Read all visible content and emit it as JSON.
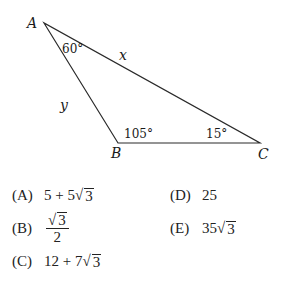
{
  "diagram": {
    "type": "triangle",
    "vertices": {
      "A": {
        "label": "A",
        "x": 44,
        "y": 23
      },
      "B": {
        "label": "B",
        "x": 118,
        "y": 143
      },
      "C": {
        "label": "C",
        "x": 260,
        "y": 143
      }
    },
    "angles": {
      "A": "60°",
      "B": "105°",
      "C": "15°"
    },
    "sides": {
      "AC": "x",
      "AB": "y"
    },
    "line_color": "#2a2a2a"
  },
  "choices": [
    {
      "key": "(A)",
      "prefix": "5 + 5",
      "radicand": "3"
    },
    {
      "key": "(B)",
      "numerator_radicand": "3",
      "denominator": "2"
    },
    {
      "key": "(C)",
      "prefix": "12 + 7",
      "radicand": "3"
    },
    {
      "key": "(D)",
      "value": "25"
    },
    {
      "key": "(E)",
      "prefix": "35",
      "radicand": "3"
    }
  ]
}
